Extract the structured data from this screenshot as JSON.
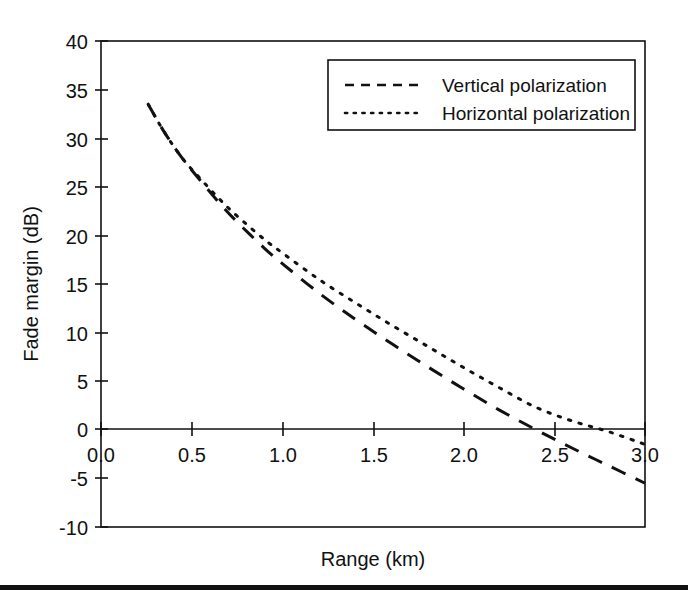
{
  "chart_data": {
    "type": "line",
    "title": "",
    "xlabel": "Range (km)",
    "ylabel": "Fade margin (dB)",
    "xlim": [
      0.0,
      3.0
    ],
    "ylim": [
      -10,
      40
    ],
    "grid": false,
    "legend_position": "top-right",
    "xticks": [
      0.0,
      0.5,
      1.0,
      1.5,
      2.0,
      2.5,
      3.0
    ],
    "xtick_labels": [
      "0.0",
      "0.5",
      "1.0",
      "1.5",
      "2.0",
      "2.5",
      "3.0"
    ],
    "yticks": [
      -10,
      -5,
      0,
      5,
      10,
      15,
      20,
      25,
      30,
      35,
      40
    ],
    "ytick_labels": [
      "-10",
      "-5",
      "0",
      "5",
      "10",
      "15",
      "20",
      "25",
      "30",
      "35",
      "40"
    ],
    "series": [
      {
        "name": "Vertical polarization",
        "style": "dashed",
        "color": "#111111",
        "x": [
          0.26,
          0.35,
          0.45,
          0.55,
          0.65,
          0.75,
          0.9,
          1.0,
          1.2,
          1.4,
          1.6,
          1.8,
          2.0,
          2.2,
          2.4,
          2.6,
          2.8,
          3.0
        ],
        "y": [
          33.5,
          30.6,
          27.9,
          25.6,
          23.4,
          21.4,
          18.7,
          17.1,
          14.1,
          11.4,
          8.9,
          6.5,
          4.2,
          2.0,
          0.0,
          -1.9,
          -3.7,
          -5.5
        ],
        "zero_crossing_km": 2.4
      },
      {
        "name": "Horizontal polarization",
        "style": "dotted",
        "color": "#111111",
        "x": [
          0.26,
          0.35,
          0.45,
          0.55,
          0.65,
          0.75,
          0.9,
          1.0,
          1.2,
          1.4,
          1.6,
          1.8,
          2.0,
          2.2,
          2.4,
          2.6,
          2.8,
          3.0
        ],
        "y": [
          33.5,
          30.6,
          27.9,
          25.8,
          23.8,
          22.0,
          19.6,
          18.2,
          15.5,
          13.1,
          10.8,
          8.6,
          6.4,
          4.3,
          2.3,
          0.9,
          -0.2,
          -1.5
        ],
        "zero_crossing_km": 2.78
      }
    ],
    "legend": [
      {
        "label": "Vertical polarization",
        "style": "dashed"
      },
      {
        "label": "Horizontal polarization",
        "style": "dotted"
      }
    ]
  },
  "figure": {
    "background": "#ffffff",
    "line_color": "#111111",
    "bottom_rule": true
  }
}
